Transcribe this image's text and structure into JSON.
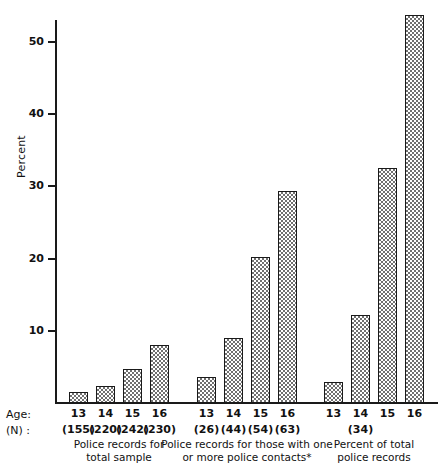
{
  "chart_data": {
    "type": "bar",
    "title": "",
    "xlabel": "",
    "ylabel": "Percent",
    "ylim": [
      0,
      55
    ],
    "yticks": [
      10,
      20,
      30,
      40,
      50
    ],
    "ytick_labels": [
      "10",
      "20",
      "30",
      "40",
      "50"
    ],
    "grid": false,
    "legend": "none",
    "row_headers": {
      "age": "Age:",
      "n": "(N) :"
    },
    "footnote": "*",
    "groups": [
      {
        "caption": "Police records for\ntotal sample",
        "categories": [
          "13",
          "14",
          "15",
          "16"
        ],
        "n_values": [
          "(155)",
          "(220)",
          "(242)",
          "(230)"
        ],
        "values": [
          1.5,
          2.4,
          4.7,
          8.0
        ]
      },
      {
        "caption": "Police records for those with one\nor more police contacts*",
        "categories": [
          "13",
          "14",
          "15",
          "16"
        ],
        "n_values": [
          "(26)",
          "(44)",
          "(54)",
          "(63)"
        ],
        "values": [
          3.6,
          9.0,
          20.2,
          29.3
        ]
      },
      {
        "caption": "Percent of total\npolice records",
        "categories": [
          "13",
          "14",
          "15",
          "16"
        ],
        "n_values": [
          "",
          "(34)",
          "",
          ""
        ],
        "values": [
          2.9,
          12.2,
          32.5,
          53.7
        ]
      }
    ]
  },
  "colors": {
    "axis": "#1a1a1a",
    "bar_outline": "#1a1a1a",
    "bar_fill": "#707070",
    "background": "#ffffff"
  }
}
